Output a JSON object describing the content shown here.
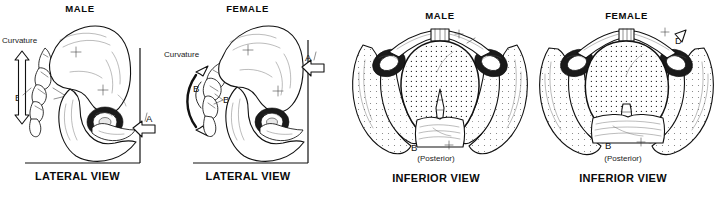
{
  "figure": {
    "background_color": "#ffffff",
    "ink_color": "#111111"
  },
  "panels": [
    {
      "id": "male-lateral",
      "sex_label": "MALE",
      "view_label": "LATERAL VIEW",
      "annotations": {
        "curvature": "Curvature",
        "curvature_letter": "B",
        "bone_letter": "B",
        "axis_letter": "A"
      },
      "arrow_type": "straight-double-headed",
      "features": {
        "sacral_curvature": "straight",
        "arrow_A_direction": "left"
      }
    },
    {
      "id": "female-lateral",
      "sex_label": "FEMALE",
      "view_label": "LATERAL VIEW",
      "annotations": {
        "curvature": "Curvature",
        "curvature_letter": "B",
        "bone_letter": "B",
        "axis_letter": "A"
      },
      "arrow_type": "curved-double-headed",
      "features": {
        "sacral_curvature": "curved",
        "arrow_A_direction": "left"
      }
    },
    {
      "id": "male-inferior",
      "sex_label": "MALE",
      "view_label": "INFERIOR VIEW",
      "orientation_label": "(Posterior)",
      "annotations": {
        "subpubic_angle_letter": "D",
        "sacrum_letter": "B"
      },
      "features": {
        "pelvic_inlet_shape": "heart-shaped",
        "subpubic_angle": "narrow"
      }
    },
    {
      "id": "female-inferior",
      "sex_label": "FEMALE",
      "view_label": "INFERIOR VIEW",
      "orientation_label": "(Posterior)",
      "annotations": {
        "subpubic_angle_letter": "D",
        "sacrum_letter": "B"
      },
      "features": {
        "pelvic_inlet_shape": "oval-rounded",
        "subpubic_angle": "wide"
      }
    }
  ]
}
